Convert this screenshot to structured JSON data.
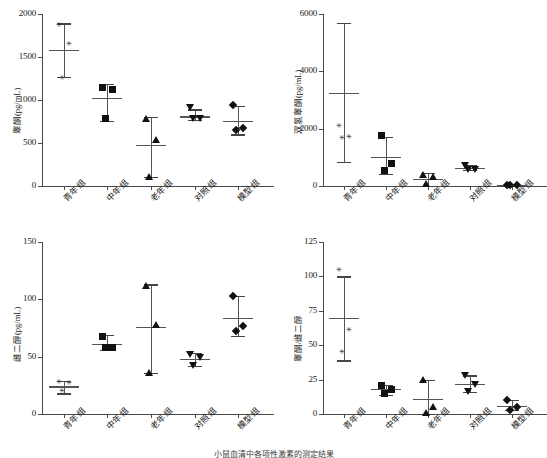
{
  "figure": {
    "groups": [
      "青年组",
      "中年组",
      "老年组",
      "对照组",
      "模型组"
    ],
    "caption": "小鼠血清中各项性激素的测定结果"
  },
  "chart_data": [
    {
      "type": "scatter",
      "id": "panel-testosterone",
      "title": "",
      "ylabel": "睾酮(pg/mL)",
      "xlabel": "",
      "ylim": [
        0,
        2000
      ],
      "yticks": [
        0,
        500,
        1000,
        1500,
        2000
      ],
      "ytick_labels": [
        "0",
        "500",
        "1000",
        "1500",
        "2000"
      ],
      "grid": false,
      "legend": "none",
      "categories": [
        "青年组",
        "中年组",
        "老年组",
        "对照组",
        "模型组"
      ],
      "markers": [
        "star",
        "square",
        "triangle-up",
        "triangle-down",
        "diamond"
      ],
      "series": [
        {
          "name": "青年组",
          "values": [
            1860,
            1640,
            1250
          ],
          "mean": 1580,
          "err_low": 1265,
          "err_high": 1890
        },
        {
          "name": "中年组",
          "values": [
            1150,
            1120,
            780
          ],
          "mean": 1020,
          "err_low": 760,
          "err_high": 1190
        },
        {
          "name": "老年组",
          "values": [
            780,
            530,
            110
          ],
          "mean": 475,
          "err_low": 105,
          "err_high": 800
        },
        {
          "name": "对照组",
          "values": [
            915,
            790,
            785
          ],
          "mean": 810,
          "err_low": 770,
          "err_high": 890
        },
        {
          "name": "模型组",
          "values": [
            940,
            680,
            655
          ],
          "mean": 760,
          "err_low": 600,
          "err_high": 930
        }
      ]
    },
    {
      "type": "scatter",
      "id": "panel-dht",
      "title": "",
      "ylabel": "双氢睾酮(pg/mL)",
      "xlabel": "",
      "ylim": [
        0,
        6000
      ],
      "yticks": [
        0,
        2000,
        4000,
        6000
      ],
      "ytick_labels": [
        "0",
        "2000",
        "4000",
        "6000"
      ],
      "grid": false,
      "legend": "none",
      "categories": [
        "青年组",
        "中年组",
        "老年组",
        "对照组",
        "模型组"
      ],
      "markers": [
        "star",
        "square",
        "triangle-up",
        "triangle-down",
        "diamond"
      ],
      "series": [
        {
          "name": "青年组",
          "values": [
            2070,
            1670,
            1650
          ],
          "mean": 3250,
          "err_low": 830,
          "err_high": 5680
        },
        {
          "name": "中年组",
          "values": [
            1760,
            780,
            540
          ],
          "mean": 1020,
          "err_low": 410,
          "err_high": 1700
        },
        {
          "name": "老年组",
          "values": [
            390,
            310,
            60
          ],
          "mean": 250,
          "err_low": 10,
          "err_high": 450
        },
        {
          "name": "对照组",
          "values": [
            720,
            580,
            610
          ],
          "mean": 620,
          "err_low": 560,
          "err_high": 740
        },
        {
          "name": "模型组",
          "values": [
            30,
            30,
            30
          ],
          "mean": 30,
          "err_low": 20,
          "err_high": 45
        }
      ]
    },
    {
      "type": "scatter",
      "id": "panel-estradiol",
      "title": "",
      "ylabel": "雌二醇(pg/mL)",
      "xlabel": "",
      "ylim": [
        0,
        150
      ],
      "yticks": [
        0,
        50,
        100,
        150
      ],
      "ytick_labels": [
        "0",
        "50",
        "100",
        "150"
      ],
      "grid": false,
      "legend": "none",
      "categories": [
        "青年组",
        "中年组",
        "老年组",
        "对照组",
        "模型组"
      ],
      "markers": [
        "star",
        "square",
        "triangle-up",
        "triangle-down",
        "diamond"
      ],
      "series": [
        {
          "name": "青年组",
          "values": [
            27,
            26,
            19
          ],
          "mean": 24,
          "err_low": 18,
          "err_high": 29
        },
        {
          "name": "中年组",
          "values": [
            68,
            58,
            58
          ],
          "mean": 61,
          "err_low": 56,
          "err_high": 69
        },
        {
          "name": "老年组",
          "values": [
            112,
            78,
            36
          ],
          "mean": 76,
          "err_low": 36,
          "err_high": 113
        },
        {
          "name": "对照组",
          "values": [
            52,
            50,
            43
          ],
          "mean": 48,
          "err_low": 42,
          "err_high": 53
        },
        {
          "name": "模型组",
          "values": [
            103,
            77,
            72
          ],
          "mean": 84,
          "err_low": 68,
          "err_high": 103
        }
      ]
    },
    {
      "type": "scatter",
      "id": "panel-ratio",
      "title": "",
      "ylabel": "睾酮/雌二醇",
      "xlabel": "",
      "ylim": [
        0,
        125
      ],
      "yticks": [
        0,
        25,
        50,
        75,
        100,
        125
      ],
      "ytick_labels": [
        "0",
        "25",
        "50",
        "75",
        "100",
        "125"
      ],
      "grid": false,
      "legend": "none",
      "categories": [
        "青年组",
        "中年组",
        "老年组",
        "对照组",
        "模型组"
      ],
      "markers": [
        "star",
        "square",
        "triangle-up",
        "triangle-down",
        "diamond"
      ],
      "series": [
        {
          "name": "青年组",
          "values": [
            104,
            60,
            44
          ],
          "mean": 70,
          "err_low": 39,
          "err_high": 100
        },
        {
          "name": "中年组",
          "values": [
            21,
            18,
            15
          ],
          "mean": 18,
          "err_low": 14,
          "err_high": 21
        },
        {
          "name": "老年组",
          "values": [
            25,
            5,
            1
          ],
          "mean": 11,
          "err_low": -2,
          "err_high": 25
        },
        {
          "name": "对照组",
          "values": [
            28,
            22,
            17
          ],
          "mean": 22,
          "err_low": 16,
          "err_high": 28
        },
        {
          "name": "模型组",
          "values": [
            10,
            5,
            3
          ],
          "mean": 6,
          "err_low": 3,
          "err_high": 10
        }
      ]
    }
  ]
}
